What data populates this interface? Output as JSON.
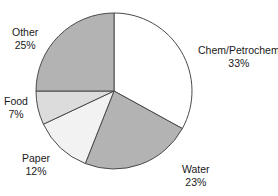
{
  "chart_data": {
    "type": "pie",
    "title": "",
    "subtitle": "",
    "xlabel": "",
    "ylabel": "",
    "legend_position": "none",
    "grid": false,
    "labels_outside": true,
    "start_angle_deg": 0,
    "direction": "clockwise",
    "categories": [
      "Chem/Petrochem",
      "Water",
      "Paper",
      "Food",
      "Other"
    ],
    "values": [
      33,
      23,
      12,
      7,
      25
    ],
    "value_unit": "%",
    "slices": [
      {
        "name": "Chem/Petrochem",
        "value": 33,
        "label": "Chem/Petrochem",
        "pct_label": "33%",
        "color": "#ffffff",
        "stroke": "#4a4a4a"
      },
      {
        "name": "Water",
        "value": 23,
        "label": "Water",
        "pct_label": "23%",
        "color": "#b3b3b3",
        "stroke": "#4a4a4a"
      },
      {
        "name": "Paper",
        "value": 12,
        "label": "Paper",
        "pct_label": "12%",
        "color": "#f2f2f2",
        "stroke": "#4a4a4a"
      },
      {
        "name": "Food",
        "value": 7,
        "label": "Food",
        "pct_label": "7%",
        "color": "#dcdcdc",
        "stroke": "#4a4a4a"
      },
      {
        "name": "Other",
        "value": 25,
        "label": "Other",
        "pct_label": "25%",
        "color": "#b3b3b3",
        "stroke": "#4a4a4a"
      }
    ],
    "geometry": {
      "center_x": 114,
      "center_y": 91,
      "radius": 78
    },
    "background_color": "#ffffff",
    "text_color": "#1a1a1a"
  }
}
